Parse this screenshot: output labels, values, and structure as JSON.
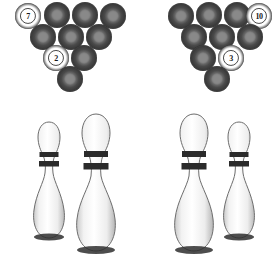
{
  "scene": {
    "title": "bowling-balls-and-pins",
    "background_color": "#ffffff",
    "width": 274,
    "height": 274
  },
  "colors": {
    "ball_dark": "#4a4a4a",
    "ball_highlight": "#8f8f8f",
    "ball_white": "#ffffff",
    "pin_body": "#f5f5f5",
    "pin_stripe": "#2b2b2b",
    "pin_outline": "#4a4a4a"
  },
  "ball_racks": [
    {
      "name": "left-rack",
      "ball_count": 10,
      "balls": [
        {
          "label": "7",
          "numbered": true,
          "x": 15,
          "y": 3
        },
        {
          "label": "",
          "numbered": false,
          "x": 44,
          "y": 2
        },
        {
          "label": "",
          "numbered": false,
          "x": 72,
          "y": 2
        },
        {
          "label": "",
          "numbered": false,
          "x": 100,
          "y": 3
        },
        {
          "label": "",
          "numbered": false,
          "x": 30,
          "y": 24
        },
        {
          "label": "",
          "numbered": false,
          "x": 58,
          "y": 24
        },
        {
          "label": "",
          "numbered": false,
          "x": 86,
          "y": 24
        },
        {
          "label": "2",
          "numbered": true,
          "x": 43,
          "y": 45
        },
        {
          "label": "",
          "numbered": false,
          "x": 71,
          "y": 45
        },
        {
          "label": "",
          "numbered": false,
          "x": 57,
          "y": 66
        }
      ]
    },
    {
      "name": "right-rack",
      "ball_count": 10,
      "balls": [
        {
          "label": "",
          "numbered": false,
          "x": 168,
          "y": 3
        },
        {
          "label": "",
          "numbered": false,
          "x": 196,
          "y": 2
        },
        {
          "label": "",
          "numbered": false,
          "x": 224,
          "y": 2
        },
        {
          "label": "10",
          "numbered": true,
          "x": 246,
          "y": 3
        },
        {
          "label": "",
          "numbered": false,
          "x": 181,
          "y": 24
        },
        {
          "label": "",
          "numbered": false,
          "x": 209,
          "y": 24
        },
        {
          "label": "",
          "numbered": false,
          "x": 237,
          "y": 24
        },
        {
          "label": "",
          "numbered": false,
          "x": 190,
          "y": 45
        },
        {
          "label": "3",
          "numbered": true,
          "x": 218,
          "y": 45
        },
        {
          "label": "",
          "numbered": false,
          "x": 204,
          "y": 66
        }
      ]
    }
  ],
  "pins": [
    {
      "name": "pin-1",
      "x": 28,
      "y": 120,
      "width": 42,
      "height": 126
    },
    {
      "name": "pin-2",
      "x": 70,
      "y": 112,
      "width": 52,
      "height": 148
    },
    {
      "name": "pin-3",
      "x": 168,
      "y": 112,
      "width": 52,
      "height": 148
    },
    {
      "name": "pin-4",
      "x": 218,
      "y": 120,
      "width": 42,
      "height": 126
    }
  ]
}
